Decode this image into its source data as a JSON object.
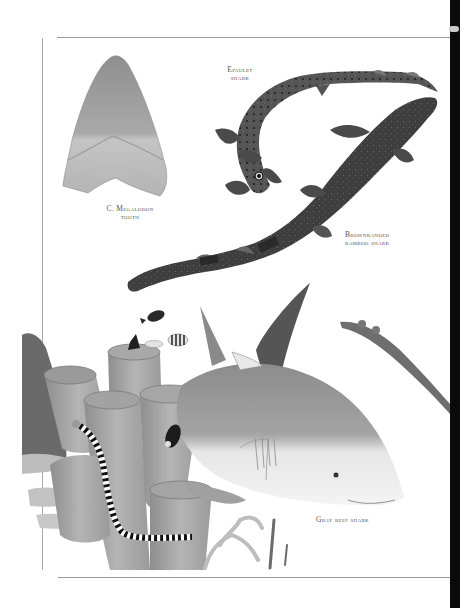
{
  "page": {
    "type": "scanned book page",
    "palette": {
      "background": "#ffffff",
      "rule": "#9a9a9a",
      "spine": "#0a0a0a",
      "label_text": "#555555",
      "illustration_dark": "#3a3a3a",
      "illustration_mid": "#8a8a8a",
      "illustration_light": "#c8c8c8"
    }
  },
  "labels": {
    "megalodon": {
      "line1": "C. Megalodon",
      "line2": "tooth"
    },
    "epaulet": {
      "line1": "Epaulet",
      "line2": "shark"
    },
    "bamboo": {
      "line1": "Brownbanded",
      "line2": "bamboo shark"
    },
    "grayreef": {
      "line1": "Gray reef shark"
    }
  },
  "illustrations": [
    {
      "name": "megalodon-tooth",
      "caption": "C. Megalodon tooth"
    },
    {
      "name": "epaulet-shark",
      "caption": "Epaulet shark"
    },
    {
      "name": "brownbanded-bamboo-shark",
      "caption": "Brownbanded bamboo shark"
    },
    {
      "name": "gray-reef-shark",
      "caption": "Gray reef shark"
    },
    {
      "name": "tube-sponges-coral",
      "caption": ""
    },
    {
      "name": "banded-sea-snake",
      "caption": ""
    },
    {
      "name": "reef-fish",
      "caption": ""
    }
  ]
}
